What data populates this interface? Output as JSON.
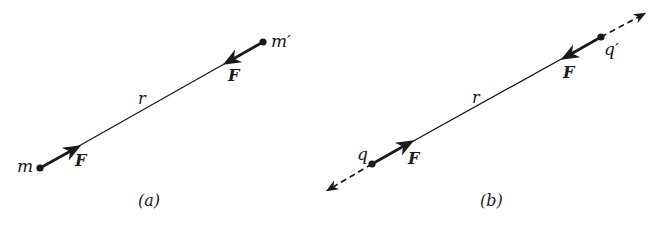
{
  "panels": [
    {
      "id": "a",
      "caption": "(a)",
      "body_left": "m",
      "body_right": "m′",
      "force_left": "F",
      "force_right": "F",
      "separation": "r"
    },
    {
      "id": "b",
      "caption": "(b)",
      "body_left": "q",
      "body_right": "q′",
      "force_left": "F",
      "force_right": "F",
      "separation": "r"
    }
  ],
  "colors": {
    "ink": "#1a1a1a",
    "background": "#ffffff"
  }
}
